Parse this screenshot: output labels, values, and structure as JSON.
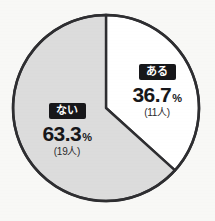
{
  "chart_data": {
    "type": "pie",
    "title": "",
    "subtitle": "",
    "xlabel": "",
    "ylabel": "",
    "legend_position": "inside-slices",
    "grid": false,
    "total_count": 30,
    "unit_suffix": "人",
    "percent_sign": "%",
    "start_angle_deg": 0,
    "direction": "clockwise",
    "categories": [
      "ある",
      "ない"
    ],
    "values": [
      36.7,
      63.3
    ],
    "counts": [
      11,
      19
    ],
    "slices": [
      {
        "label": "ある",
        "percent_value": "36.7",
        "percent_sign": "%",
        "percent_text": "36.7%",
        "count_text": "(11人)",
        "count": 11,
        "value": 36.7,
        "fill": "#ffffff",
        "stroke": "#2e2e31",
        "badge_bg": "#17171a",
        "badge_fg": "#ffffff"
      },
      {
        "label": "ない",
        "percent_value": "63.3",
        "percent_sign": "%",
        "percent_text": "63.3%",
        "count_text": "(19人)",
        "count": 19,
        "value": 63.3,
        "fill": "#dcdcdc",
        "stroke": "#2e2e31",
        "badge_bg": "#17171a",
        "badge_fg": "#ffffff"
      }
    ],
    "colors": {
      "background": "#f8f8f6",
      "outline": "#2e2e31",
      "slice_aru": "#ffffff",
      "slice_nai": "#dcdcdc",
      "text": "#17171a"
    },
    "geometry": {
      "center_x": 106,
      "center_y": 108,
      "radius": 93
    }
  }
}
